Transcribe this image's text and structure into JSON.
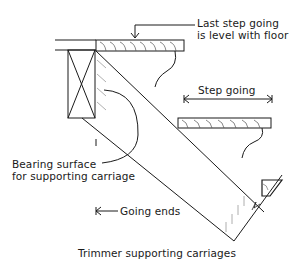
{
  "title": "Trimmer supporting carriages",
  "labels": {
    "last_step_line1": "Last step going",
    "last_step_line2": "is level with floor",
    "step_going": "Step going",
    "bearing_line1": "Bearing surface",
    "bearing_line2": "for supporting carriage",
    "going_ends": "Going ends",
    "caption": "Trimmer supporting carriages"
  },
  "colors": {
    "ink": "#1a1a1a",
    "hatch": "#9a9a9a",
    "background": "#ffffff"
  }
}
